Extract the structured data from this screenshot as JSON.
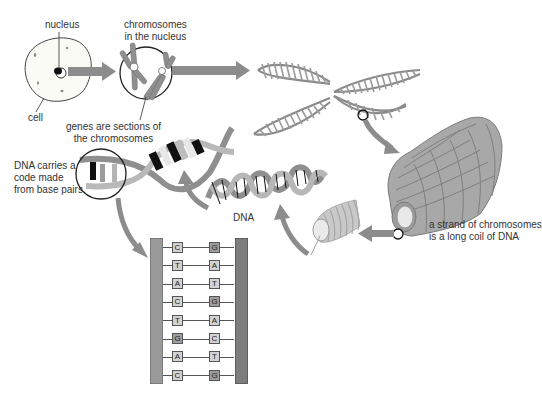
{
  "labels": {
    "nucleus": "nucleus",
    "cell": "cell",
    "chromosomes_in_nucleus_line1": "chromosomes",
    "chromosomes_in_nucleus_line2": "in the nucleus",
    "genes_line1": "genes are sections of",
    "genes_line2": "the chromosomes",
    "dna_code_line1": "DNA carries a",
    "dna_code_line2": "code made",
    "dna_code_line3": "from base pairs",
    "dna": "DNA",
    "strand_line1": "a strand of chromosomes",
    "strand_line2": "is a long coil of DNA"
  },
  "base_pairs": [
    {
      "left": "C",
      "right": "G"
    },
    {
      "left": "T",
      "right": "A"
    },
    {
      "left": "A",
      "right": "T"
    },
    {
      "left": "C",
      "right": "G"
    },
    {
      "left": "T",
      "right": "A"
    },
    {
      "left": "G",
      "right": "C"
    },
    {
      "left": "A",
      "right": "T"
    },
    {
      "left": "C",
      "right": "G"
    }
  ],
  "colors": {
    "arrow": "#8c8c8c",
    "coil": "#a6a6a6",
    "coil_stroke": "#7a7a7a",
    "base_light": "#d2d2d2",
    "base_dark_G": "#9c9c9c"
  }
}
